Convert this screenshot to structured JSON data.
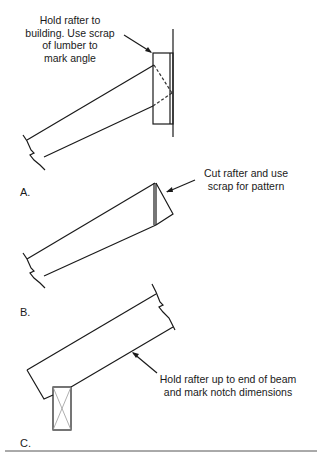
{
  "panels": [
    {
      "label": "A.",
      "annotation": [
        "Hold rafter to",
        "building. Use scrap",
        "of lumber to",
        "mark angle"
      ]
    },
    {
      "label": "B.",
      "annotation": [
        "Cut rafter and use",
        "scrap for pattern"
      ]
    },
    {
      "label": "C.",
      "annotation": [
        "Hold rafter up to end of beam",
        "and mark notch dimensions"
      ]
    }
  ],
  "caption": "",
  "colors": {
    "line": "#1a1a1a",
    "dashed": "#333333",
    "beam_x": "#9a9a9a",
    "rule": "#555555"
  }
}
